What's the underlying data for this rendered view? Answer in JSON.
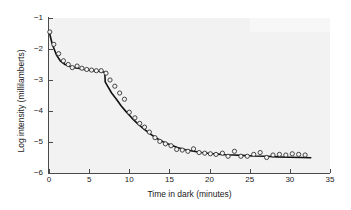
{
  "chart_data": {
    "type": "scatter",
    "title": "",
    "xlabel": "Time in dark (minutes)",
    "ylabel": "Log intensity (millilamberts)",
    "xlim": [
      0,
      35
    ],
    "ylim": [
      -6,
      -1
    ],
    "xticks": [
      0,
      5,
      10,
      15,
      20,
      25,
      30,
      35
    ],
    "xtick_labels": [
      "0",
      "5",
      "10",
      "15",
      "20",
      "25",
      "30",
      "35"
    ],
    "yticks": [
      -1,
      -2,
      -3,
      -4,
      -5,
      -6
    ],
    "ytick_labels": [
      "−1",
      "−2",
      "−3",
      "−4",
      "−5",
      "−6"
    ],
    "grid": false,
    "legend": false,
    "marker": "open-circle",
    "marker_color": "#333333",
    "line_color": "#111111",
    "background": "#f2f2f2",
    "series": [
      {
        "name": "Observed threshold",
        "type": "scatter",
        "x": [
          0.1,
          0.6,
          1.2,
          1.8,
          2.4,
          2.9,
          3.5,
          4.1,
          4.7,
          5.3,
          5.9,
          6.5,
          7.1,
          7.6,
          8.2,
          8.8,
          9.4,
          10.0,
          10.7,
          11.3,
          11.9,
          12.5,
          13.2,
          13.8,
          14.5,
          15.2,
          15.9,
          16.6,
          17.3,
          18.0,
          18.7,
          19.4,
          20.1,
          20.8,
          21.6,
          22.3,
          23.1,
          23.9,
          24.7,
          25.5,
          26.3,
          27.1,
          27.9,
          28.7,
          29.5,
          30.3,
          31.1,
          31.9
        ],
        "y": [
          -1.45,
          -1.85,
          -2.15,
          -2.38,
          -2.5,
          -2.6,
          -2.55,
          -2.62,
          -2.66,
          -2.68,
          -2.7,
          -2.7,
          -2.78,
          -3.0,
          -3.2,
          -3.42,
          -3.62,
          -4.04,
          -4.22,
          -4.4,
          -4.52,
          -4.68,
          -4.86,
          -4.98,
          -5.06,
          -5.12,
          -5.24,
          -5.26,
          -5.3,
          -5.22,
          -5.34,
          -5.36,
          -5.38,
          -5.4,
          -5.36,
          -5.46,
          -5.3,
          -5.46,
          -5.46,
          -5.4,
          -5.34,
          -5.5,
          -5.42,
          -5.4,
          -5.42,
          -5.38,
          -5.4,
          -5.42
        ]
      },
      {
        "name": "Fitted two-branch curve",
        "type": "line",
        "x": [
          0.0,
          0.4,
          0.9,
          1.4,
          2.0,
          2.6,
          3.2,
          3.8,
          4.4,
          5.0,
          5.6,
          6.2,
          6.8,
          6.95,
          7.0,
          7.3,
          7.8,
          8.4,
          9.0,
          9.6,
          10.3,
          11.0,
          11.8,
          12.6,
          13.4,
          14.2,
          15.0,
          16.0,
          17.0,
          18.0,
          19.0,
          20.0,
          21.0,
          22.0,
          23.0,
          24.0,
          25.5,
          27.0,
          28.5,
          30.0,
          31.5,
          32.6
        ],
        "y": [
          -1.42,
          -1.84,
          -2.18,
          -2.38,
          -2.5,
          -2.56,
          -2.6,
          -2.63,
          -2.66,
          -2.68,
          -2.7,
          -2.72,
          -2.74,
          -2.76,
          -3.06,
          -3.2,
          -3.42,
          -3.62,
          -3.84,
          -4.02,
          -4.22,
          -4.4,
          -4.58,
          -4.74,
          -4.88,
          -4.99,
          -5.08,
          -5.18,
          -5.25,
          -5.3,
          -5.34,
          -5.37,
          -5.39,
          -5.41,
          -5.42,
          -5.43,
          -5.45,
          -5.46,
          -5.48,
          -5.49,
          -5.5,
          -5.51
        ]
      }
    ],
    "annotations": {
      "rod_cone_break_minutes": 7.0,
      "cone_plateau_log_intensity": -2.7,
      "rod_asymptote_log_intensity": -5.5
    }
  }
}
